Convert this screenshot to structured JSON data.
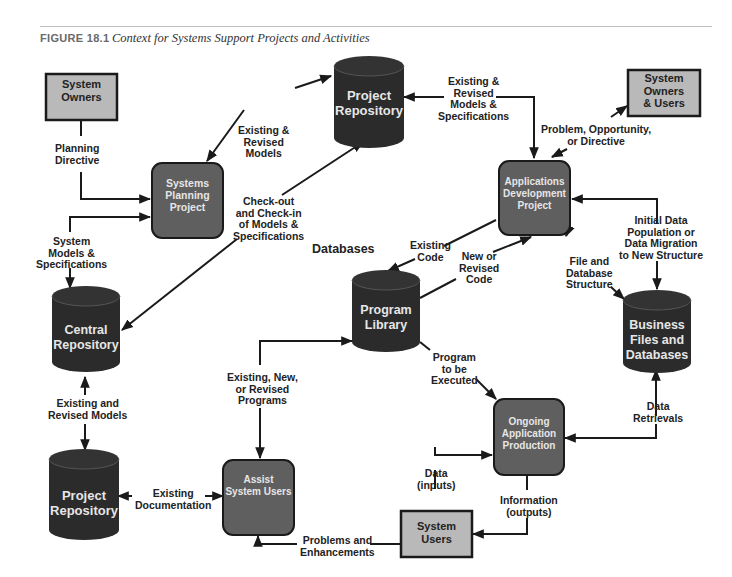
{
  "figure": {
    "number": "FIGURE 18.1",
    "title": "Context for Systems Support Projects and Activities"
  },
  "colors": {
    "external_entity_fill": "#b9b9b9",
    "process_fill": "#5f5f5f",
    "datastore_fill": "#2b2b2b",
    "line": "#1a1a1a",
    "node_text": "#e6e6e6"
  },
  "nodes": {
    "system_owners": "System\nOwners",
    "system_owners_users": "System\nOwners\n& Users",
    "system_users": "System\nUsers",
    "systems_planning_project": "Systems\nPlanning\nProject",
    "applications_development_project": "Applications\nDevelopment\nProject",
    "ongoing_application_production": "Ongoing\nApplication\nProduction",
    "assist_system_users": "Assist\nSystem Users",
    "project_repository_top": "Project\nRepository",
    "central_repository": "Central\nRepository",
    "project_repository_bottom": "Project\nRepository",
    "program_library": "Program\nLibrary",
    "business_files_databases": "Business\nFiles and\nDatabases"
  },
  "section_labels": {
    "databases": "Databases"
  },
  "flows": {
    "planning_directive": "Planning\nDirective",
    "existing_revised_models": "Existing &\nRevised\nModels",
    "existing_revised_models_specs": "Existing &\nRevised\nModels &\nSpecifications",
    "problem_opportunity_directive": "Problem, Opportunity,\nor Directive",
    "system_models_specs": "System\nModels &\nSpecifications",
    "checkout_checkin": "Check-out\nand Check-in\nof Models &\nSpecifications",
    "existing_code": "Existing\nCode",
    "new_revised_code": "New or\nRevised\nCode",
    "file_db_structure": "File and\nDatabase\nStructure",
    "initial_data_population": "Initial Data\nPopulation or\nData Migration\nto New Structure",
    "program_to_be_executed": "Program\nto be\nExecuted",
    "existing_and_revised_models": "Existing and\nRevised Models",
    "existing_new_revised_programs": "Existing, New,\nor Revised\nPrograms",
    "data_retrievals": "Data\nRetrievals",
    "existing_documentation": "Existing\nDocumentation",
    "data_inputs": "Data\n(inputs)",
    "information_outputs": "Information\n(outputs)",
    "problems_enhancements": "Problems and\nEnhancements"
  }
}
